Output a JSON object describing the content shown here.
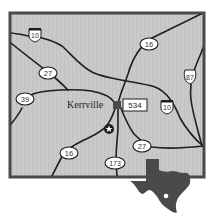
{
  "map": {
    "city": {
      "name": "Kerrville",
      "marker": "city-square-marker"
    },
    "landmark": {
      "icon": "star-icon"
    },
    "routes": {
      "i10_west": {
        "label": "10",
        "type": "interstate-shield"
      },
      "i10_east": {
        "label": "10",
        "type": "interstate-shield"
      },
      "us87": {
        "label": "87",
        "type": "us-highway-shield"
      },
      "sh16_north": {
        "label": "16",
        "type": "state-oval"
      },
      "sh16_south": {
        "label": "16",
        "type": "state-oval"
      },
      "sh27_west": {
        "label": "27",
        "type": "state-oval"
      },
      "sh27_east": {
        "label": "27",
        "type": "state-oval"
      },
      "sh39": {
        "label": "39",
        "type": "state-oval"
      },
      "sh173": {
        "label": "173",
        "type": "state-oval"
      },
      "fm534": {
        "label": "534",
        "type": "farm-road-box"
      }
    },
    "inset": {
      "shape": "texas-state-silhouette",
      "dot": "location-dot"
    },
    "colors": {
      "background": "#c9c9c9",
      "frame": "#4a4a4a",
      "road": "#1e1e1e",
      "inset": "#4a4a4a"
    }
  }
}
